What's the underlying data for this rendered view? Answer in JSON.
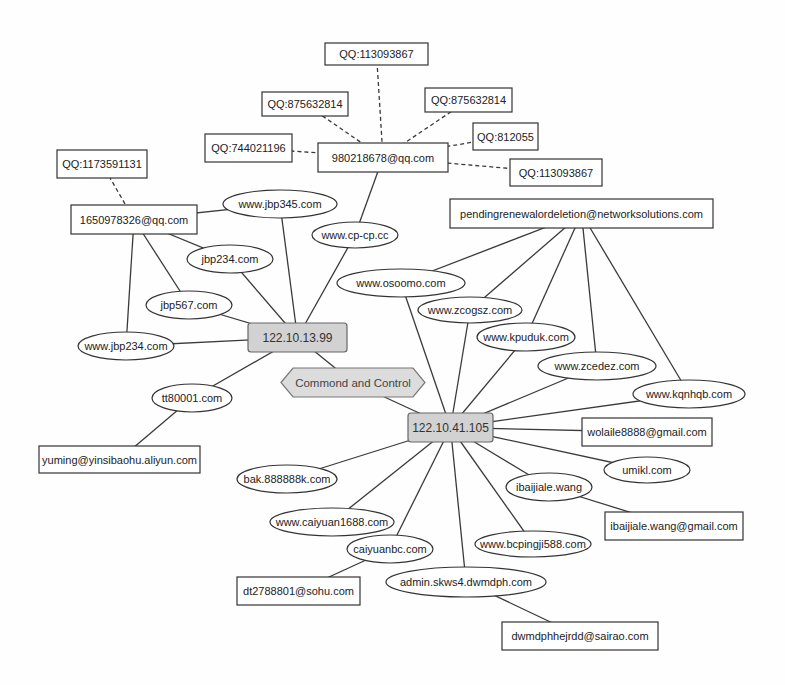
{
  "diagram": {
    "title": "",
    "nodes": [
      {
        "id": "qq_113093867_top",
        "label": "QQ:113093867",
        "kind": "qq"
      },
      {
        "id": "qq_875632814_left",
        "label": "QQ:875632814",
        "kind": "qq"
      },
      {
        "id": "qq_875632814_right",
        "label": "QQ:875632814",
        "kind": "qq"
      },
      {
        "id": "qq_812055",
        "label": "QQ:812055",
        "kind": "qq"
      },
      {
        "id": "qq_113093867_right",
        "label": "QQ:113093867",
        "kind": "qq"
      },
      {
        "id": "qq_744021196",
        "label": "QQ:744021196",
        "kind": "qq"
      },
      {
        "id": "email_980218678",
        "label": "980218678@qq.com",
        "kind": "email"
      },
      {
        "id": "qq_1173591131",
        "label": "QQ:1173591131",
        "kind": "qq"
      },
      {
        "id": "email_1650978326",
        "label": "1650978326@qq.com",
        "kind": "email"
      },
      {
        "id": "dom_jbp345",
        "label": "www.jbp345.com",
        "kind": "domain"
      },
      {
        "id": "dom_cpcp",
        "label": "www.cp-cp.cc",
        "kind": "domain"
      },
      {
        "id": "dom_jbp234",
        "label": "jbp234.com",
        "kind": "domain"
      },
      {
        "id": "dom_jbp567",
        "label": "jbp567.com",
        "kind": "domain"
      },
      {
        "id": "dom_www_jbp234",
        "label": "www.jbp234.com",
        "kind": "domain"
      },
      {
        "id": "ip_122_10_13_99",
        "label": "122.10.13.99",
        "kind": "ip"
      },
      {
        "id": "cc",
        "label": "Commond and Control",
        "kind": "c2"
      },
      {
        "id": "ip_122_10_41_105",
        "label": "122.10.41.105",
        "kind": "ip"
      },
      {
        "id": "dom_tt80001",
        "label": "tt80001.com",
        "kind": "domain"
      },
      {
        "id": "email_yuming",
        "label": "yuming@yinsibaohu.aliyun.com",
        "kind": "email"
      },
      {
        "id": "email_pending",
        "label": "pendingrenewalordeletion@networksolutions.com",
        "kind": "email"
      },
      {
        "id": "dom_osoomo",
        "label": "www.osoomo.com",
        "kind": "domain"
      },
      {
        "id": "dom_zcogsz",
        "label": "www.zcogsz.com",
        "kind": "domain"
      },
      {
        "id": "dom_kpuduk",
        "label": "www.kpuduk.com",
        "kind": "domain"
      },
      {
        "id": "dom_zcedez",
        "label": "www.zcedez.com",
        "kind": "domain"
      },
      {
        "id": "dom_kqnhqb",
        "label": "www.kqnhqb.com",
        "kind": "domain"
      },
      {
        "id": "email_wolaile",
        "label": "wolaile8888@gmail.com",
        "kind": "email"
      },
      {
        "id": "dom_umikl",
        "label": "umikl.com",
        "kind": "domain"
      },
      {
        "id": "dom_ibaijiale",
        "label": "ibaijiale.wang",
        "kind": "domain"
      },
      {
        "id": "email_ibaijiale",
        "label": "ibaijiale.wang@gmail.com",
        "kind": "email"
      },
      {
        "id": "dom_bcpingji",
        "label": "www.bcpingji588.com",
        "kind": "domain"
      },
      {
        "id": "dom_bak",
        "label": "bak.888888k.com",
        "kind": "domain"
      },
      {
        "id": "dom_caiyuan1688",
        "label": "www.caiyuan1688.com",
        "kind": "domain"
      },
      {
        "id": "dom_caiyuanbc",
        "label": "caiyuanbc.com",
        "kind": "domain"
      },
      {
        "id": "email_dt2788801",
        "label": "dt2788801@sohu.com",
        "kind": "email"
      },
      {
        "id": "dom_admin",
        "label": "admin.skws4.dwmdph.com",
        "kind": "domain"
      },
      {
        "id": "email_dwmdph",
        "label": "dwmdphhejrdd@sairao.com",
        "kind": "email"
      }
    ],
    "edges": [
      {
        "from": "qq_113093867_top",
        "to": "email_980218678",
        "style": "dashed"
      },
      {
        "from": "qq_875632814_left",
        "to": "email_980218678",
        "style": "dashed"
      },
      {
        "from": "qq_875632814_right",
        "to": "email_980218678",
        "style": "dashed"
      },
      {
        "from": "qq_812055",
        "to": "email_980218678",
        "style": "dashed"
      },
      {
        "from": "qq_113093867_right",
        "to": "email_980218678",
        "style": "dashed"
      },
      {
        "from": "qq_744021196",
        "to": "email_980218678",
        "style": "dashed"
      },
      {
        "from": "qq_1173591131",
        "to": "email_1650978326",
        "style": "dashed"
      },
      {
        "from": "email_980218678",
        "to": "dom_cpcp",
        "style": "solid"
      },
      {
        "from": "dom_cpcp",
        "to": "ip_122_10_13_99",
        "style": "solid"
      },
      {
        "from": "email_1650978326",
        "to": "dom_jbp345",
        "style": "solid"
      },
      {
        "from": "dom_jbp345",
        "to": "ip_122_10_13_99",
        "style": "solid"
      },
      {
        "from": "email_1650978326",
        "to": "dom_jbp234",
        "style": "solid"
      },
      {
        "from": "dom_jbp234",
        "to": "ip_122_10_13_99",
        "style": "solid"
      },
      {
        "from": "email_1650978326",
        "to": "dom_jbp567",
        "style": "solid"
      },
      {
        "from": "dom_jbp567",
        "to": "ip_122_10_13_99",
        "style": "solid"
      },
      {
        "from": "email_1650978326",
        "to": "dom_www_jbp234",
        "style": "solid"
      },
      {
        "from": "dom_www_jbp234",
        "to": "ip_122_10_13_99",
        "style": "solid"
      },
      {
        "from": "ip_122_10_13_99",
        "to": "dom_tt80001",
        "style": "solid"
      },
      {
        "from": "dom_tt80001",
        "to": "email_yuming",
        "style": "solid"
      },
      {
        "from": "ip_122_10_13_99",
        "to": "cc",
        "style": "solid"
      },
      {
        "from": "cc",
        "to": "ip_122_10_41_105",
        "style": "solid"
      },
      {
        "from": "email_pending",
        "to": "dom_osoomo",
        "style": "solid"
      },
      {
        "from": "email_pending",
        "to": "dom_zcogsz",
        "style": "solid"
      },
      {
        "from": "email_pending",
        "to": "dom_kpuduk",
        "style": "solid"
      },
      {
        "from": "email_pending",
        "to": "dom_zcedez",
        "style": "solid"
      },
      {
        "from": "email_pending",
        "to": "dom_kqnhqb",
        "style": "solid"
      },
      {
        "from": "ip_122_10_41_105",
        "to": "dom_osoomo",
        "style": "solid"
      },
      {
        "from": "ip_122_10_41_105",
        "to": "dom_zcogsz",
        "style": "solid"
      },
      {
        "from": "ip_122_10_41_105",
        "to": "dom_kpuduk",
        "style": "solid"
      },
      {
        "from": "ip_122_10_41_105",
        "to": "dom_zcedez",
        "style": "solid"
      },
      {
        "from": "ip_122_10_41_105",
        "to": "dom_kqnhqb",
        "style": "solid"
      },
      {
        "from": "ip_122_10_41_105",
        "to": "email_wolaile",
        "style": "solid"
      },
      {
        "from": "ip_122_10_41_105",
        "to": "dom_umikl",
        "style": "solid"
      },
      {
        "from": "ip_122_10_41_105",
        "to": "dom_ibaijiale",
        "style": "solid"
      },
      {
        "from": "dom_ibaijiale",
        "to": "email_ibaijiale",
        "style": "solid"
      },
      {
        "from": "ip_122_10_41_105",
        "to": "dom_bcpingji",
        "style": "solid"
      },
      {
        "from": "ip_122_10_41_105",
        "to": "dom_admin",
        "style": "solid"
      },
      {
        "from": "dom_admin",
        "to": "email_dwmdph",
        "style": "solid"
      },
      {
        "from": "ip_122_10_41_105",
        "to": "dom_caiyuanbc",
        "style": "solid"
      },
      {
        "from": "dom_caiyuanbc",
        "to": "email_dt2788801",
        "style": "solid"
      },
      {
        "from": "ip_122_10_41_105",
        "to": "dom_caiyuan1688",
        "style": "solid"
      },
      {
        "from": "ip_122_10_41_105",
        "to": "dom_bak",
        "style": "solid"
      }
    ]
  }
}
